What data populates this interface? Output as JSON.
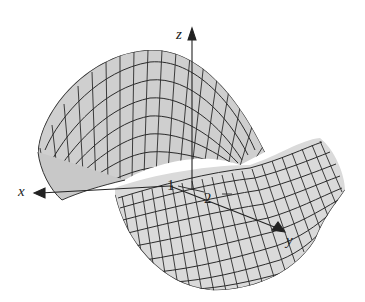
{
  "figure": {
    "surface_fill": "#d2d2d2",
    "mesh_color": "#2a2a2a",
    "axis_color": "#222222"
  },
  "axes": {
    "x_label": "x",
    "y_label": "y",
    "z_label": "z"
  },
  "ticks": {
    "y_tick_1": "1",
    "y_tick_2": "2"
  }
}
